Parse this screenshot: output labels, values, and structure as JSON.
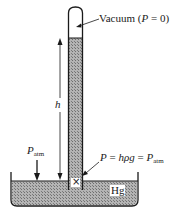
{
  "diagram": {
    "labels": {
      "vacuum": "Vacuum (",
      "vacuum_P": "P",
      "vacuum_eq": " = 0)",
      "height": "h",
      "patm_P": "P",
      "patm_sub": "atm",
      "eq_P": "P",
      "eq_mid": " = ",
      "eq_hpg": "hρg",
      "eq_mid2": " = ",
      "eq_P2": "P",
      "eq_sub": "atm",
      "fluid": "Hg",
      "point_marker": "×"
    },
    "colors": {
      "line": "#1a1a1a",
      "mercury_fill": "#9a9a9a",
      "background": "#ffffff"
    }
  }
}
